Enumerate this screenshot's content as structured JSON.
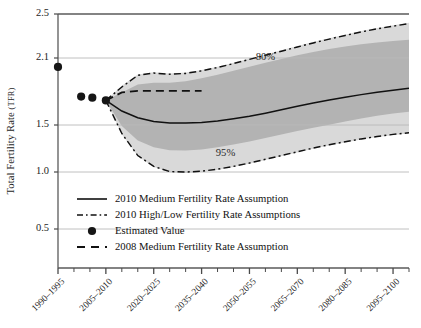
{
  "chart_data": {
    "type": "line",
    "title": "",
    "xlabel": "",
    "ylabel": "Total Fertility Rate",
    "ylabel_smallcaps": "(TFR)",
    "ylim": [
      0.35,
      2.62
    ],
    "yticks": [
      0.5,
      1.0,
      1.5,
      2.1,
      2.5
    ],
    "ytick_labels": [
      "0.5",
      "1.0",
      "1.5",
      "2.1",
      "2.5"
    ],
    "gridlines_y": [
      0.5,
      1.0,
      1.5,
      2.1,
      2.5
    ],
    "grid": true,
    "legend_position": "inside-lower-left",
    "xtick_labels": [
      "1990–1995",
      "2005–2010",
      "2020–2025",
      "2035–2040",
      "2050–2055",
      "2065–2070",
      "2080–2085",
      "2095–2100"
    ],
    "x_minor_ticks_per_major": 3,
    "x_total_periods": 22,
    "annotations": [
      {
        "text": "80%",
        "x_period": 13.0,
        "y": 2.08,
        "name": "eighty-percent-band-label"
      },
      {
        "text": "95%",
        "x_period": 10.5,
        "y": 1.17,
        "name": "ninetyfive-percent-band-label"
      }
    ],
    "series": [
      {
        "name": "Estimated Value",
        "style": "points",
        "x_periods": [
          0.0,
          1.45,
          2.15,
          3.0
        ],
        "values": [
          2.02,
          1.755,
          1.745,
          1.72
        ]
      },
      {
        "name": "2010 Medium Fertility Rate Assumption",
        "style": "solid",
        "x_periods": [
          3.0,
          4.0,
          5.0,
          6.0,
          7.0,
          8.0,
          9.0,
          10.0,
          11.0,
          12.0,
          13.0,
          14.0,
          15.0,
          16.0,
          17.0,
          18.0,
          19.0,
          20.0,
          21.0,
          22.0
        ],
        "values": [
          1.72,
          1.625,
          1.565,
          1.532,
          1.519,
          1.517,
          1.522,
          1.536,
          1.556,
          1.579,
          1.606,
          1.636,
          1.667,
          1.697,
          1.724,
          1.749,
          1.772,
          1.793,
          1.812,
          1.828
        ]
      },
      {
        "name": "2010 High Fertility Rate Assumption",
        "style": "dash-dot",
        "x_periods": [
          3.0,
          4.0,
          5.0,
          6.0,
          7.0,
          8.0,
          9.0,
          10.0,
          11.0,
          12.0,
          13.0,
          14.0,
          15.0,
          16.0,
          17.0,
          18.0,
          19.0,
          20.0,
          21.0,
          22.0
        ],
        "values": [
          1.72,
          1.84,
          1.945,
          1.965,
          1.955,
          1.962,
          1.985,
          2.015,
          2.05,
          2.088,
          2.125,
          2.162,
          2.2,
          2.237,
          2.272,
          2.305,
          2.337,
          2.365,
          2.39,
          2.412
        ]
      },
      {
        "name": "2010 Low Fertility Rate Assumption",
        "style": "dash-dot",
        "x_periods": [
          3.0,
          4.0,
          5.0,
          6.0,
          7.0,
          8.0,
          9.0,
          10.0,
          11.0,
          12.0,
          13.0,
          14.0,
          15.0,
          16.0,
          17.0,
          18.0,
          19.0,
          20.0,
          21.0,
          22.0
        ],
        "values": [
          1.72,
          1.41,
          1.175,
          1.06,
          1.005,
          1.0,
          1.008,
          1.03,
          1.06,
          1.095,
          1.135,
          1.175,
          1.215,
          1.255,
          1.29,
          1.322,
          1.352,
          1.378,
          1.4,
          1.418
        ]
      },
      {
        "name": "80% Upper Bound",
        "style": "band",
        "x_periods": [
          3.0,
          4.0,
          5.0,
          6.0,
          7.0,
          8.0,
          9.0,
          10.0,
          11.0,
          12.0,
          13.0,
          14.0,
          15.0,
          16.0,
          17.0,
          18.0,
          19.0,
          20.0,
          21.0,
          22.0
        ],
        "values": [
          1.72,
          1.79,
          1.862,
          1.878,
          1.878,
          1.892,
          1.918,
          1.95,
          1.985,
          2.022,
          2.058,
          2.092,
          2.125,
          2.155,
          2.182,
          2.205,
          2.225,
          2.242,
          2.255,
          2.265
        ]
      },
      {
        "name": "80% Lower Bound",
        "style": "band",
        "x_periods": [
          3.0,
          4.0,
          5.0,
          6.0,
          7.0,
          8.0,
          9.0,
          10.0,
          11.0,
          12.0,
          13.0,
          14.0,
          15.0,
          16.0,
          17.0,
          18.0,
          19.0,
          20.0,
          21.0,
          22.0
        ],
        "values": [
          1.72,
          1.49,
          1.335,
          1.262,
          1.232,
          1.228,
          1.24,
          1.262,
          1.292,
          1.325,
          1.362,
          1.398,
          1.435,
          1.47,
          1.502,
          1.532,
          1.558,
          1.582,
          1.602,
          1.618
        ]
      },
      {
        "name": "95% Upper Bound",
        "style": "band",
        "x_periods": [
          3.0,
          4.0,
          5.0,
          6.0,
          7.0,
          8.0,
          9.0,
          10.0,
          11.0,
          12.0,
          13.0,
          14.0,
          15.0,
          16.0,
          17.0,
          18.0,
          19.0,
          20.0,
          21.0,
          22.0
        ],
        "values": [
          1.72,
          1.852,
          1.952,
          1.972,
          1.962,
          1.97,
          1.992,
          2.022,
          2.058,
          2.095,
          2.132,
          2.17,
          2.208,
          2.245,
          2.28,
          2.312,
          2.345,
          2.372,
          2.398,
          2.42
        ]
      },
      {
        "name": "95% Lower Bound",
        "style": "band",
        "x_periods": [
          3.0,
          4.0,
          5.0,
          6.0,
          7.0,
          8.0,
          9.0,
          10.0,
          11.0,
          12.0,
          13.0,
          14.0,
          15.0,
          16.0,
          17.0,
          18.0,
          19.0,
          20.0,
          21.0,
          22.0
        ],
        "values": [
          1.72,
          1.402,
          1.168,
          1.052,
          0.998,
          0.992,
          1.0,
          1.022,
          1.052,
          1.088,
          1.128,
          1.168,
          1.208,
          1.248,
          1.282,
          1.315,
          1.345,
          1.372,
          1.392,
          1.412
        ]
      },
      {
        "name": "2008 Medium Fertility Rate Assumption",
        "style": "dashed",
        "x_periods": [
          3.0,
          4.0,
          5.0,
          6.0,
          7.0,
          8.0,
          9.0
        ],
        "values": [
          1.72,
          1.792,
          1.805,
          1.805,
          1.805,
          1.805,
          1.805
        ]
      }
    ],
    "colors": {
      "band_95": "#d6d6d6",
      "band_80": "#b0b0b0",
      "line": "#111111",
      "grid": "#b9b9b9",
      "axis": "#555555",
      "point": "#161616"
    }
  },
  "legend": {
    "items": [
      {
        "label": "2010 Medium Fertility Rate Assumption",
        "marker": "solid-line",
        "name": "legend-item-medium-2010"
      },
      {
        "label": "2010 High/Low Fertility Rate Assumptions",
        "marker": "dash-dot-line",
        "name": "legend-item-highlow-2010"
      },
      {
        "label": "Estimated Value",
        "marker": "dot",
        "name": "legend-item-estimated-value"
      },
      {
        "label": "2008 Medium Fertility Rate Assumption",
        "marker": "dashed-line",
        "name": "legend-item-medium-2008"
      }
    ]
  },
  "caption": {
    "text": ""
  }
}
